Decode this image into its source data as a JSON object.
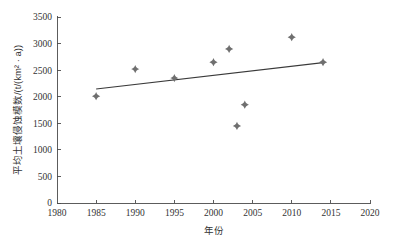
{
  "chart_data": {
    "type": "scatter",
    "title": "",
    "xlabel": "年份",
    "ylabel": "平均土壤侵蚀模数/(t/(km² · a))",
    "xlim": [
      1980,
      2020
    ],
    "ylim": [
      0,
      3500
    ],
    "xticks": [
      1980,
      1985,
      1990,
      1995,
      2000,
      2005,
      2010,
      2015,
      2020
    ],
    "xtick_labels": [
      "1980",
      "1985",
      "1990",
      "1995",
      "2000",
      "2005",
      "2010",
      "2015",
      "2020"
    ],
    "yticks": [
      0,
      500,
      1000,
      1500,
      2000,
      2500,
      3000,
      3500
    ],
    "ytick_labels": [
      "0",
      "500",
      "1000",
      "1500",
      "2000",
      "2500",
      "3000",
      "3500"
    ],
    "grid": false,
    "legend": "none",
    "series": [
      {
        "name": "平均土壤侵蚀模数",
        "marker": "diamond",
        "color": "#6f6f6f",
        "points": [
          {
            "x": 1985,
            "y": 2010
          },
          {
            "x": 1990,
            "y": 2520
          },
          {
            "x": 1995,
            "y": 2350
          },
          {
            "x": 2000,
            "y": 2650
          },
          {
            "x": 2002,
            "y": 2900
          },
          {
            "x": 2003,
            "y": 1450
          },
          {
            "x": 2004,
            "y": 1850
          },
          {
            "x": 2010,
            "y": 3120
          },
          {
            "x": 2014,
            "y": 2650
          }
        ]
      }
    ],
    "trendline": {
      "type": "linear",
      "color": "#3a3a3a",
      "x_start": 1985,
      "y_start": 2145,
      "x_end": 2014,
      "y_end": 2640
    }
  },
  "axes": {
    "x_axis_name": "年份",
    "y_axis_name": "平均土壤侵蚀模数/(t/(km² · a))"
  }
}
